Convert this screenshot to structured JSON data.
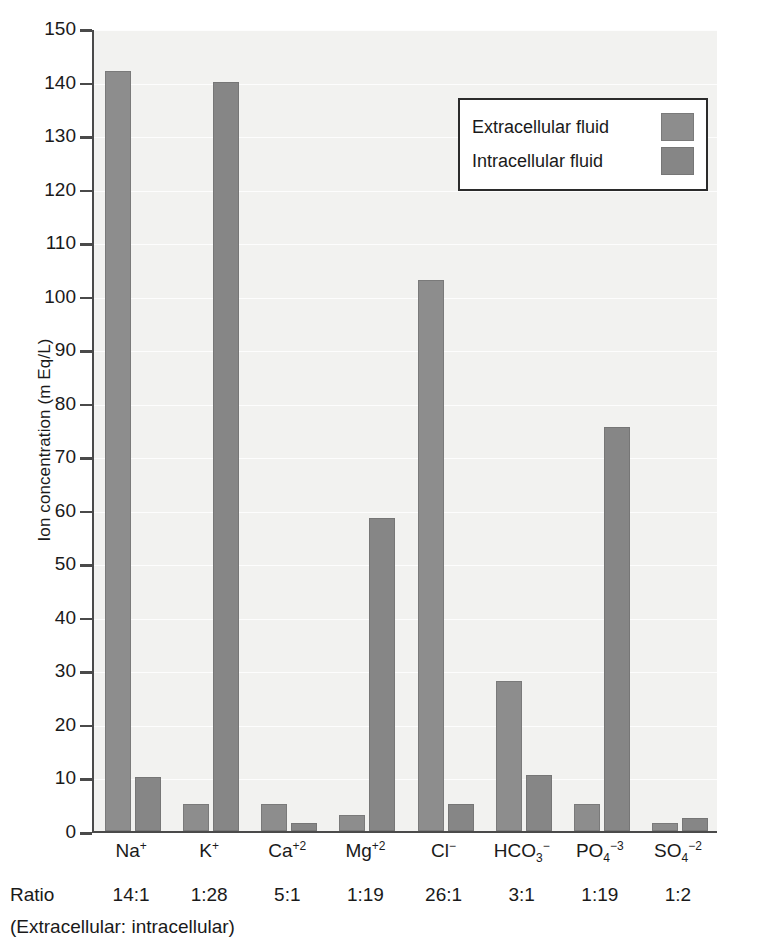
{
  "chart_data": {
    "type": "bar",
    "title": "",
    "xlabel": "",
    "ylabel": "Ion concentration (m Eq/L)",
    "ylim": [
      0,
      150
    ],
    "ytick_step": 10,
    "yticks": [
      0,
      10,
      20,
      30,
      40,
      50,
      60,
      70,
      80,
      90,
      100,
      110,
      120,
      130,
      140,
      150
    ],
    "grid": true,
    "legend_position": "upper-right",
    "categories": [
      "Na+",
      "K+",
      "Ca+2",
      "Mg+2",
      "Cl-",
      "HCO3-",
      "PO4-3",
      "SO4-2"
    ],
    "category_labels": [
      {
        "base": "Na",
        "sup": "+",
        "sub": ""
      },
      {
        "base": "K",
        "sup": "+",
        "sub": ""
      },
      {
        "base": "Ca",
        "sup": "+2",
        "sub": ""
      },
      {
        "base": "Mg",
        "sup": "+2",
        "sub": ""
      },
      {
        "base": "Cl",
        "sup": "−",
        "sub": ""
      },
      {
        "base": "HCO",
        "sup": "−",
        "sub": "3"
      },
      {
        "base": "PO",
        "sup": "−3",
        "sub": "4"
      },
      {
        "base": "SO",
        "sup": "−2",
        "sub": "4"
      }
    ],
    "series": [
      {
        "name": "Extracellular fluid",
        "color": "#8d8d8d",
        "values": [
          142,
          5,
          5,
          3,
          103,
          28,
          5,
          1.5
        ]
      },
      {
        "name": "Intracellular fluid",
        "color": "#868686",
        "values": [
          10,
          140,
          1.5,
          58.5,
          5,
          10.5,
          75.5,
          2.5
        ]
      }
    ],
    "annotations": {
      "ratio_label": "Ratio",
      "ratio_values": [
        "14:1",
        "1:28",
        "5:1",
        "1:19",
        "26:1",
        "3:1",
        "1:19",
        "1:2"
      ],
      "ratio_note": "(Extracellular: intracellular)"
    }
  },
  "legend": {
    "items": [
      {
        "label": "Extracellular fluid"
      },
      {
        "label": "Intracellular fluid"
      }
    ]
  }
}
